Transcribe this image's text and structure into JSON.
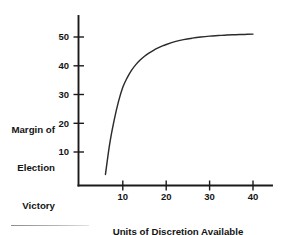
{
  "chart_data": {
    "type": "line",
    "title": "",
    "subtitle": "",
    "xlabel": "Units of Discretion Available for Consumption",
    "xlabel_lines": [
      "Units of Discretion Available",
      "for Consumption"
    ],
    "ylabel": "Margin of Election Victory",
    "ylabel_lines": [
      "Margin of",
      "Election",
      "Victory"
    ],
    "xlim": [
      0,
      44
    ],
    "ylim": [
      0,
      57
    ],
    "xticks": [
      10,
      20,
      30,
      40
    ],
    "xtick_labels": [
      "10",
      "20",
      "30",
      "40"
    ],
    "yticks": [
      10,
      20,
      30,
      40,
      50
    ],
    "ytick_labels": [
      "10",
      "20",
      "30",
      "40",
      "50"
    ],
    "grid": false,
    "legend": false,
    "legend_position": "none",
    "series": [
      {
        "name": "Margin of Election Victory",
        "color": "#2b2b2b",
        "x": [
          6,
          7,
          8,
          9,
          10,
          11,
          12,
          13,
          14,
          15,
          16,
          17,
          18,
          19,
          20,
          22,
          24,
          26,
          28,
          30,
          32,
          34,
          36,
          38,
          40
        ],
        "values": [
          2.2,
          13.0,
          21.0,
          27.5,
          32.5,
          35.8,
          38.4,
          40.4,
          42.0,
          43.3,
          44.4,
          45.3,
          46.1,
          46.8,
          47.4,
          48.4,
          49.1,
          49.6,
          50.0,
          50.3,
          50.5,
          50.7,
          50.8,
          50.9,
          51.0
        ]
      }
    ]
  },
  "axis_labels": {
    "y_line1": "Margin of",
    "y_line2": "Election",
    "y_line3": "Victory",
    "x_line1": "Units of Discretion Available",
    "x_line2": "for Consumption"
  },
  "colors": {
    "curve": "#2b2b2b",
    "axis": "#1a1a1a",
    "text": "#141414",
    "background": "#ffffff"
  }
}
